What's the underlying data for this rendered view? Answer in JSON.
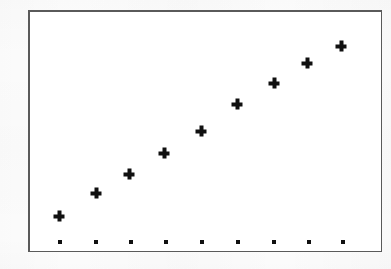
{
  "figure": {
    "kind": "scatter-plot",
    "background_color": "#fdfdfd",
    "plot_background_color": "#ffffff",
    "frame_color": "#5a5a5a",
    "frame_width_px": 1.5,
    "marker_color": "#101010",
    "frame": {
      "left": 28,
      "top": 10,
      "width": 354,
      "height": 242
    }
  },
  "chart_data": {
    "type": "scatter",
    "title": "",
    "subtitle": "",
    "xlabel": "",
    "ylabel": "",
    "grid": false,
    "legend": "none",
    "axis_tick_labels_visible": false,
    "xlim": [
      0,
      10
    ],
    "ylim": [
      0,
      10
    ],
    "series": [
      {
        "name": "data",
        "marker": "plus",
        "marker_size_px": 11,
        "marker_thickness_px": 4,
        "x": [
          1,
          2,
          3,
          4,
          5,
          6,
          7,
          8,
          9
        ],
        "y": [
          1.5,
          2.5,
          3.3,
          4.2,
          5.2,
          6.3,
          7.2,
          8.0,
          8.8
        ],
        "pixels": [
          {
            "x": 59,
            "y": 216
          },
          {
            "x": 96,
            "y": 193
          },
          {
            "x": 129,
            "y": 174
          },
          {
            "x": 164,
            "y": 153
          },
          {
            "x": 201,
            "y": 131
          },
          {
            "x": 237,
            "y": 104
          },
          {
            "x": 274,
            "y": 83
          },
          {
            "x": 307,
            "y": 63
          },
          {
            "x": 341,
            "y": 46
          }
        ]
      },
      {
        "name": "baseline",
        "marker": "square",
        "marker_size_px": 4,
        "x": [
          1,
          2,
          3,
          4,
          5,
          6,
          7,
          8,
          9
        ],
        "y": [
          0.28,
          0.28,
          0.28,
          0.28,
          0.28,
          0.28,
          0.28,
          0.28,
          0.28
        ],
        "pixels": [
          {
            "x": 60,
            "y": 242
          },
          {
            "x": 96,
            "y": 242
          },
          {
            "x": 131,
            "y": 242
          },
          {
            "x": 166,
            "y": 242
          },
          {
            "x": 202,
            "y": 242
          },
          {
            "x": 238,
            "y": 242
          },
          {
            "x": 274,
            "y": 242
          },
          {
            "x": 309,
            "y": 242
          },
          {
            "x": 343,
            "y": 242
          }
        ]
      }
    ]
  }
}
